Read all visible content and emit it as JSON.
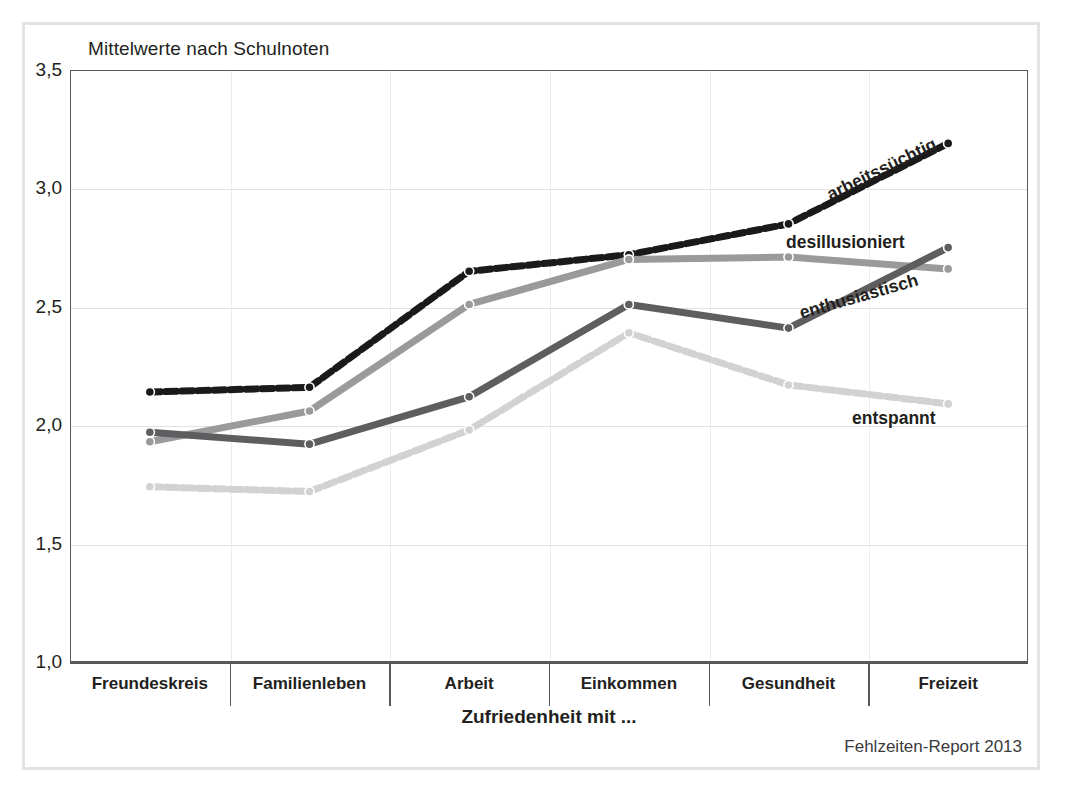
{
  "figure": {
    "title": "Mittelwerte nach Schulnoten",
    "source_note": "Fehlzeiten-Report 2013",
    "xaxis_title": "Zufriedenheit mit ..."
  },
  "chart_data": {
    "type": "line",
    "title": "Mittelwerte nach Schulnoten",
    "xlabel": "Zufriedenheit mit ...",
    "ylabel": "",
    "ylim": [
      1.0,
      3.5
    ],
    "yticks": [
      "1,0",
      "1,5",
      "2,0",
      "2,5",
      "3,0",
      "3,5"
    ],
    "ytick_values": [
      1.0,
      1.5,
      2.0,
      2.5,
      3.0,
      3.5
    ],
    "grid": true,
    "legend": "inline-labels",
    "categories": [
      "Freundeskreis",
      "Familienleben",
      "Arbeit",
      "Einkommen",
      "Gesundheit",
      "Freizeit"
    ],
    "series": [
      {
        "name": "arbeitssüchtig",
        "color": "#1a1a1a",
        "style": "dashed",
        "values": [
          2.14,
          2.16,
          2.65,
          2.72,
          2.85,
          3.19
        ]
      },
      {
        "name": "desillusioniert",
        "color": "#9a9a9c",
        "style": "solid",
        "values": [
          1.93,
          2.06,
          2.51,
          2.7,
          2.71,
          2.66
        ]
      },
      {
        "name": "enthusiastisch",
        "color": "#5e5e60",
        "style": "solid",
        "values": [
          1.97,
          1.92,
          2.12,
          2.51,
          2.41,
          2.75
        ]
      },
      {
        "name": "entspannt",
        "color": "#d2d2d4",
        "style": "dashed",
        "values": [
          1.74,
          1.72,
          1.98,
          2.39,
          2.17,
          2.09
        ]
      }
    ],
    "annotations": [
      {
        "text": "arbeitssüchtig",
        "x": 828,
        "y": 185,
        "rotation": -26
      },
      {
        "text": "desillusioniert",
        "x": 786,
        "y": 232,
        "rotation": 0
      },
      {
        "text": "enthusiastisch",
        "x": 800,
        "y": 303,
        "rotation": -16
      },
      {
        "text": "entspannt",
        "x": 852,
        "y": 408,
        "rotation": 0
      }
    ]
  }
}
